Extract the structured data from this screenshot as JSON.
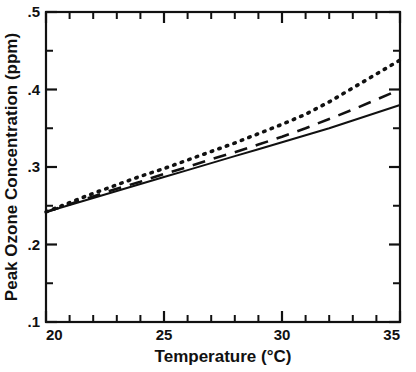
{
  "chart_data": {
    "type": "line",
    "title": "",
    "subtitle": "",
    "xlabel": "Temperature (°C)",
    "ylabel": "Peak Ozone Concentration (ppm)",
    "xlim": [
      20,
      35
    ],
    "ylim": [
      0.1,
      0.5
    ],
    "grid": false,
    "legend_position": "none",
    "x_major_ticks": [
      20,
      25,
      30,
      35
    ],
    "x_major_tick_labels": [
      "20",
      "25",
      "30",
      "35"
    ],
    "x_minor_ticks": [
      21,
      22,
      23,
      24,
      26,
      27,
      28,
      29,
      31,
      32,
      33,
      34
    ],
    "y_major_ticks": [
      0.1,
      0.2,
      0.3,
      0.4,
      0.5
    ],
    "y_major_tick_labels": [
      ".1",
      ".2",
      ".3",
      ".4",
      ".5"
    ],
    "y_minor_ticks": [
      0.15,
      0.25,
      0.35,
      0.45
    ],
    "x": [
      20,
      21,
      22,
      23,
      24,
      25,
      26,
      27,
      28,
      29,
      30,
      31,
      32,
      33,
      34,
      35
    ],
    "series": [
      {
        "name": "solid",
        "style": "solid",
        "color": "#111111",
        "values": [
          0.242,
          0.251,
          0.26,
          0.269,
          0.278,
          0.287,
          0.296,
          0.305,
          0.314,
          0.323,
          0.332,
          0.341,
          0.35,
          0.36,
          0.37,
          0.38
        ]
      },
      {
        "name": "dashed",
        "style": "dashed",
        "color": "#111111",
        "values": [
          0.242,
          0.252,
          0.262,
          0.272,
          0.281,
          0.291,
          0.3,
          0.31,
          0.319,
          0.329,
          0.339,
          0.35,
          0.362,
          0.374,
          0.387,
          0.4
        ]
      },
      {
        "name": "dotted",
        "style": "dotted",
        "color": "#111111",
        "values": [
          0.242,
          0.254,
          0.266,
          0.277,
          0.288,
          0.298,
          0.309,
          0.32,
          0.331,
          0.343,
          0.355,
          0.368,
          0.384,
          0.402,
          0.42,
          0.438
        ]
      }
    ]
  },
  "axes": {
    "x_label": "Temperature (°C)",
    "y_label": "Peak Ozone Concentration (ppm)",
    "x_tick_labels": [
      "20",
      "25",
      "30",
      "35"
    ],
    "y_tick_labels": [
      ".5",
      ".4",
      ".3",
      ".2",
      ".1"
    ]
  },
  "colors": {
    "axis": "#111111",
    "curve": "#111111",
    "background": "#ffffff"
  }
}
